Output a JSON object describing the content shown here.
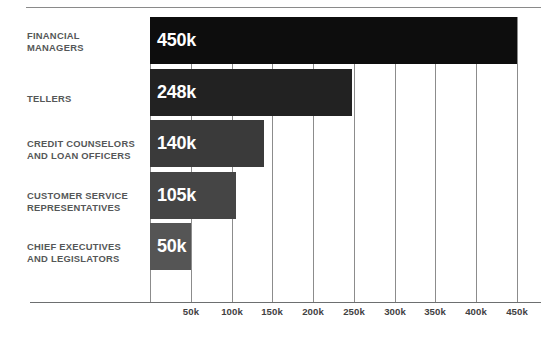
{
  "chart_data": {
    "type": "bar",
    "orientation": "horizontal",
    "title": "",
    "subtitle": "",
    "xlabel": "",
    "ylabel": "",
    "grid": true,
    "legend": null,
    "xlim": [
      0,
      450000
    ],
    "categories": [
      "FINANCIAL MANAGERS",
      "TELLERS",
      "CREDIT COUNSELORS AND LOAN OFFICERS",
      "CUSTOMER SERVICE REPRESENTATIVES",
      "CHIEF EXECUTIVES AND LEGISLATORS"
    ],
    "values": [
      450000,
      248000,
      140000,
      105000,
      50000
    ],
    "value_labels": [
      "450k",
      "248k",
      "140k",
      "105k",
      "50k"
    ],
    "bar_colors": [
      "#0d0d0d",
      "#222222",
      "#3a3a3a",
      "#454545",
      "#555555"
    ],
    "tick_values": [
      50000,
      100000,
      150000,
      200000,
      250000,
      300000,
      350000,
      400000,
      450000
    ],
    "tick_labels": [
      "50k",
      "100k",
      "150k",
      "200k",
      "250k",
      "300k",
      "350k",
      "400k",
      "450k"
    ]
  },
  "bars": [
    {
      "label_line1": "FINANCIAL",
      "label_line2": "MANAGERS",
      "value_label": "450k"
    },
    {
      "label_line1": "TELLERS",
      "label_line2": "",
      "value_label": "248k"
    },
    {
      "label_line1": "CREDIT COUNSELORS",
      "label_line2": "AND LOAN OFFICERS",
      "value_label": "140k"
    },
    {
      "label_line1": "CUSTOMER SERVICE",
      "label_line2": "REPRESENTATIVES",
      "value_label": "105k"
    },
    {
      "label_line1": "CHIEF EXECUTIVES",
      "label_line2": "AND LEGISLATORS",
      "value_label": "50k"
    }
  ],
  "axis": {
    "ticks": [
      "50k",
      "100k",
      "150k",
      "200k",
      "250k",
      "300k",
      "350k",
      "400k",
      "450k"
    ]
  },
  "colors": {
    "background": "#ffffff",
    "rule": "#8a8a8a",
    "gridline": "#8c8c8c",
    "baseline": "#6d6f70",
    "category_text": "#555758",
    "tick_text": "#3f4142",
    "value_text": "#ffffff"
  }
}
